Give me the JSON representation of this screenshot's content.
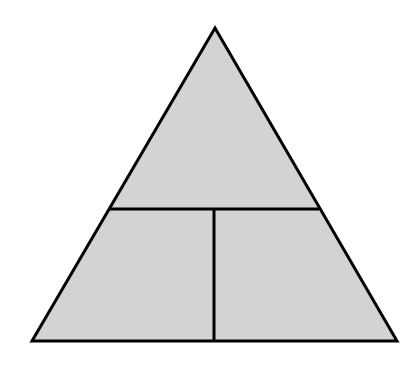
{
  "diagram": {
    "type": "triangle-partition",
    "fill_color": "#d3d3d3",
    "stroke_color": "#000000",
    "stroke_width": 3,
    "triangle": {
      "apex": [
        215,
        28
      ],
      "base_left": [
        32,
        341
      ],
      "base_right": [
        397,
        341
      ]
    },
    "horizontal_divider": {
      "y": 209,
      "x1": 110,
      "x2": 319
    },
    "vertical_divider": {
      "x": 214,
      "y1": 209,
      "y2": 341
    },
    "regions": [
      "top-section",
      "bottom-left-section",
      "bottom-right-section"
    ]
  }
}
